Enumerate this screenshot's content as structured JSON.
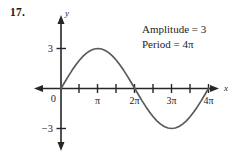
{
  "problem": {
    "number": "17."
  },
  "annotations": {
    "amplitude_text": "Amplitude = 3",
    "period_text": "Period = 4π"
  },
  "axes": {
    "y_axis_label": "y",
    "x_axis_label": "x",
    "origin_label": "0",
    "y_tick_positive": "3",
    "y_tick_negative": "−3",
    "x_tick_labels": [
      "π",
      "2π",
      "3π",
      "4π"
    ]
  },
  "colors": {
    "curve": "#5a5a5a",
    "axis": "#262626",
    "text": "#1d1d1d",
    "background": "#ffffff"
  },
  "chart_data": {
    "type": "line",
    "title": "",
    "subtitle": "",
    "xlabel": "x",
    "ylabel": "y",
    "amplitude": 3,
    "period": 12.566370614,
    "equation": "y = 3 sin(x/2)",
    "xlim": [
      -1.5,
      13.6
    ],
    "ylim": [
      -4.6,
      4.6
    ],
    "grid": false,
    "legend": null,
    "xticks": [
      3.14159265,
      6.28318531,
      9.42477796,
      12.56637061
    ],
    "xticklabels": [
      "π",
      "2π",
      "3π",
      "4π"
    ],
    "xminorticks": [
      1.57079633,
      4.71238898,
      7.85398163,
      10.99557429
    ],
    "yticks": [
      3,
      -3
    ],
    "yticklabels": [
      "3",
      "−3"
    ],
    "annotations": [
      "Amplitude = 3",
      "Period = 4π"
    ],
    "series": [
      {
        "name": "y = 3 sin(x/2)",
        "x": [
          0.0,
          0.3141593,
          0.6283185,
          0.9424778,
          1.2566371,
          1.5707963,
          1.8849556,
          2.1991149,
          2.5132741,
          2.8274334,
          3.1415927,
          3.4557519,
          3.7699112,
          4.0840704,
          4.3982297,
          4.712389,
          5.0265482,
          5.3407075,
          5.6548668,
          5.969026,
          6.2831853,
          6.5973446,
          6.9115038,
          7.2256631,
          7.5398224,
          7.8539816,
          8.1681409,
          8.4823002,
          8.7964594,
          9.1106187,
          9.424778,
          9.7389372,
          10.0530965,
          10.3672558,
          10.681415,
          10.9955743,
          11.3097336,
          11.6238928,
          11.9380521,
          12.2522113,
          12.5663706
        ],
        "y": [
          0.0,
          0.4694716,
          0.927051,
          1.361488,
          1.7633558,
          2.1213203,
          2.427051,
          2.6730326,
          2.8531695,
          2.9631302,
          3.0,
          2.9631302,
          2.8531695,
          2.6730326,
          2.427051,
          2.1213203,
          1.7633558,
          1.361488,
          0.927051,
          0.4694716,
          0.0,
          -0.4694716,
          -0.927051,
          -1.361488,
          -1.7633558,
          -2.1213203,
          -2.427051,
          -2.6730326,
          -2.8531695,
          -2.9631302,
          -3.0,
          -2.9631302,
          -2.8531695,
          -2.6730326,
          -2.427051,
          -2.1213203,
          -1.7633558,
          -1.361488,
          -0.927051,
          -0.4694716,
          0.0
        ]
      }
    ]
  }
}
